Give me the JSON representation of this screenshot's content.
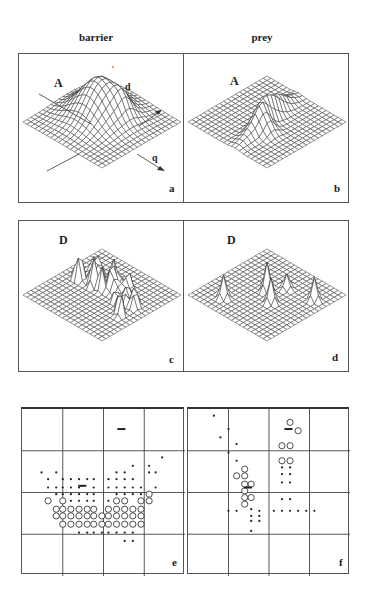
{
  "figure": {
    "columns": [
      {
        "title": "barrier"
      },
      {
        "title": "prey"
      }
    ],
    "panels": {
      "a": {
        "letter": "a",
        "quantity": "A",
        "axis_d": "d",
        "axis_q": "q",
        "tick": "'",
        "surface": "smooth_peak",
        "peak": {
          "cx": 0.42,
          "cy": 0.45,
          "h": 38,
          "w": 0.18
        }
      },
      "b": {
        "letter": "b",
        "quantity": "A",
        "surface": "ridge",
        "peak": {
          "cx": 0.55,
          "cy": 0.5,
          "h": 26,
          "w": 0.16
        }
      },
      "c": {
        "letter": "c",
        "quantity": "D",
        "surface": "spiky_many"
      },
      "d": {
        "letter": "d",
        "quantity": "D",
        "surface": "spiky_few"
      },
      "e": {
        "letter": "e"
      },
      "f": {
        "letter": "f"
      }
    },
    "colors": {
      "ink": "#333333",
      "grid": "#444444",
      "bg": "#ffffff"
    }
  },
  "chart_data": [
    {
      "type": "surface",
      "panel": "a",
      "title": "barrier",
      "zlabel": "A",
      "axes": [
        "d",
        "q"
      ],
      "description": "3D mesh surface with a single smooth central hill"
    },
    {
      "type": "surface",
      "panel": "b",
      "title": "prey",
      "zlabel": "A",
      "description": "3D mesh surface with an elongated ridge"
    },
    {
      "type": "surface",
      "panel": "c",
      "title": "barrier",
      "zlabel": "D",
      "description": "3D mesh surface with many sharp peaks along a band"
    },
    {
      "type": "surface",
      "panel": "d",
      "title": "prey",
      "zlabel": "D",
      "description": "3D mesh surface with a few isolated sharp peaks"
    },
    {
      "type": "scatter",
      "panel": "e",
      "title": "barrier",
      "grid": "4x4",
      "legend": [
        "dot = small response",
        "circle = large response",
        "bar = marker"
      ],
      "dots": [
        [
          0.86,
          0.29
        ],
        [
          0.68,
          0.34
        ],
        [
          0.78,
          0.34
        ],
        [
          0.12,
          0.38
        ],
        [
          0.21,
          0.38
        ],
        [
          0.58,
          0.38
        ],
        [
          0.63,
          0.38
        ],
        [
          0.78,
          0.38
        ],
        [
          0.82,
          0.38
        ],
        [
          0.16,
          0.42
        ],
        [
          0.25,
          0.42
        ],
        [
          0.3,
          0.42
        ],
        [
          0.35,
          0.42
        ],
        [
          0.4,
          0.42
        ],
        [
          0.44,
          0.42
        ],
        [
          0.53,
          0.42
        ],
        [
          0.58,
          0.42
        ],
        [
          0.63,
          0.42
        ],
        [
          0.68,
          0.42
        ],
        [
          0.16,
          0.47
        ],
        [
          0.21,
          0.47
        ],
        [
          0.25,
          0.47
        ],
        [
          0.3,
          0.47
        ],
        [
          0.35,
          0.47
        ],
        [
          0.44,
          0.47
        ],
        [
          0.53,
          0.47
        ],
        [
          0.58,
          0.47
        ],
        [
          0.63,
          0.47
        ],
        [
          0.68,
          0.47
        ],
        [
          0.73,
          0.47
        ],
        [
          0.82,
          0.47
        ],
        [
          0.21,
          0.51
        ],
        [
          0.25,
          0.51
        ],
        [
          0.3,
          0.51
        ],
        [
          0.35,
          0.51
        ],
        [
          0.4,
          0.51
        ],
        [
          0.44,
          0.51
        ],
        [
          0.58,
          0.51
        ],
        [
          0.63,
          0.51
        ],
        [
          0.68,
          0.51
        ],
        [
          0.73,
          0.51
        ],
        [
          0.25,
          0.55
        ],
        [
          0.3,
          0.55
        ],
        [
          0.35,
          0.55
        ],
        [
          0.4,
          0.55
        ],
        [
          0.44,
          0.55
        ],
        [
          0.53,
          0.55
        ],
        [
          0.35,
          0.74
        ],
        [
          0.4,
          0.74
        ],
        [
          0.44,
          0.74
        ],
        [
          0.49,
          0.74
        ],
        [
          0.53,
          0.74
        ],
        [
          0.58,
          0.74
        ],
        [
          0.63,
          0.74
        ],
        [
          0.68,
          0.74
        ],
        [
          0.63,
          0.79
        ],
        [
          0.68,
          0.79
        ]
      ],
      "circles": [
        [
          0.78,
          0.51
        ],
        [
          0.16,
          0.55
        ],
        [
          0.25,
          0.55
        ],
        [
          0.73,
          0.55
        ],
        [
          0.78,
          0.55
        ],
        [
          0.58,
          0.55
        ],
        [
          0.63,
          0.55
        ],
        [
          0.21,
          0.6
        ],
        [
          0.25,
          0.6
        ],
        [
          0.3,
          0.6
        ],
        [
          0.35,
          0.6
        ],
        [
          0.4,
          0.6
        ],
        [
          0.44,
          0.6
        ],
        [
          0.53,
          0.6
        ],
        [
          0.58,
          0.6
        ],
        [
          0.63,
          0.6
        ],
        [
          0.68,
          0.6
        ],
        [
          0.73,
          0.6
        ],
        [
          0.21,
          0.64
        ],
        [
          0.25,
          0.64
        ],
        [
          0.3,
          0.64
        ],
        [
          0.35,
          0.64
        ],
        [
          0.4,
          0.64
        ],
        [
          0.44,
          0.64
        ],
        [
          0.49,
          0.64
        ],
        [
          0.53,
          0.64
        ],
        [
          0.58,
          0.64
        ],
        [
          0.63,
          0.64
        ],
        [
          0.68,
          0.64
        ],
        [
          0.73,
          0.64
        ],
        [
          0.25,
          0.69
        ],
        [
          0.3,
          0.69
        ],
        [
          0.35,
          0.69
        ],
        [
          0.4,
          0.69
        ],
        [
          0.44,
          0.69
        ],
        [
          0.49,
          0.69
        ],
        [
          0.53,
          0.69
        ],
        [
          0.58,
          0.69
        ],
        [
          0.63,
          0.69
        ],
        [
          0.68,
          0.69
        ],
        [
          0.73,
          0.69
        ]
      ],
      "bars": [
        [
          0.61,
          0.12
        ],
        [
          0.37,
          0.46
        ]
      ]
    },
    {
      "type": "scatter",
      "panel": "f",
      "title": "prey",
      "grid": "4x4",
      "dots": [
        [
          0.16,
          0.04
        ],
        [
          0.25,
          0.12
        ],
        [
          0.2,
          0.17
        ],
        [
          0.3,
          0.21
        ],
        [
          0.25,
          0.26
        ],
        [
          0.3,
          0.31
        ],
        [
          0.58,
          0.35
        ],
        [
          0.63,
          0.35
        ],
        [
          0.58,
          0.39
        ],
        [
          0.63,
          0.39
        ],
        [
          0.58,
          0.44
        ],
        [
          0.63,
          0.44
        ],
        [
          0.58,
          0.54
        ],
        [
          0.63,
          0.54
        ],
        [
          0.25,
          0.61
        ],
        [
          0.3,
          0.61
        ],
        [
          0.39,
          0.6
        ],
        [
          0.44,
          0.61
        ],
        [
          0.53,
          0.61
        ],
        [
          0.58,
          0.61
        ],
        [
          0.63,
          0.61
        ],
        [
          0.68,
          0.61
        ],
        [
          0.73,
          0.61
        ],
        [
          0.78,
          0.61
        ],
        [
          0.39,
          0.64
        ],
        [
          0.44,
          0.64
        ],
        [
          0.39,
          0.67
        ],
        [
          0.44,
          0.67
        ],
        [
          0.39,
          0.73
        ]
      ],
      "circles": [
        [
          0.63,
          0.08
        ],
        [
          0.68,
          0.13
        ],
        [
          0.58,
          0.22
        ],
        [
          0.63,
          0.22
        ],
        [
          0.58,
          0.31
        ],
        [
          0.63,
          0.31
        ],
        [
          0.35,
          0.36
        ],
        [
          0.3,
          0.4
        ],
        [
          0.35,
          0.4
        ],
        [
          0.35,
          0.45
        ],
        [
          0.39,
          0.45
        ],
        [
          0.35,
          0.49
        ],
        [
          0.35,
          0.53
        ],
        [
          0.39,
          0.53
        ],
        [
          0.35,
          0.57
        ]
      ],
      "bars": [
        [
          0.62,
          0.12
        ],
        [
          0.37,
          0.47
        ]
      ]
    }
  ]
}
